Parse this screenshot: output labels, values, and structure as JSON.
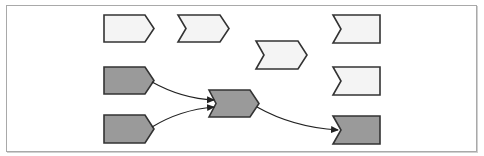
{
  "diagram": {
    "type": "process-flow",
    "colors": {
      "light_fill": "#f4f4f4",
      "dark_fill": "#9a9a9a",
      "stroke": "#333333",
      "frame": "#a9a9a9"
    },
    "nodes": [
      {
        "id": "n1",
        "shape": "pentagon-arrow",
        "variant": "light",
        "x": 104,
        "y": 15,
        "w": 50,
        "h": 27
      },
      {
        "id": "n2",
        "shape": "chevron",
        "variant": "light",
        "x": 178,
        "y": 15,
        "w": 51,
        "h": 27
      },
      {
        "id": "n3",
        "shape": "chevron",
        "variant": "light",
        "x": 256,
        "y": 41,
        "w": 51,
        "h": 28
      },
      {
        "id": "n4",
        "shape": "notched-left",
        "variant": "light",
        "x": 333,
        "y": 15,
        "w": 47,
        "h": 28
      },
      {
        "id": "n5",
        "shape": "notched-left",
        "variant": "light",
        "x": 333,
        "y": 67,
        "w": 47,
        "h": 28
      },
      {
        "id": "n6",
        "shape": "pentagon-arrow",
        "variant": "dark",
        "x": 104,
        "y": 67,
        "w": 50,
        "h": 27
      },
      {
        "id": "n7",
        "shape": "pentagon-arrow",
        "variant": "dark",
        "x": 104,
        "y": 115,
        "w": 50,
        "h": 28
      },
      {
        "id": "n8",
        "shape": "chevron",
        "variant": "dark",
        "x": 209,
        "y": 90,
        "w": 50,
        "h": 27
      },
      {
        "id": "n9",
        "shape": "notched-left",
        "variant": "dark",
        "x": 333,
        "y": 116,
        "w": 47,
        "h": 28
      }
    ],
    "edges": [
      {
        "from": "n6",
        "to": "n8"
      },
      {
        "from": "n7",
        "to": "n8"
      },
      {
        "from": "n8",
        "to": "n9"
      }
    ]
  }
}
